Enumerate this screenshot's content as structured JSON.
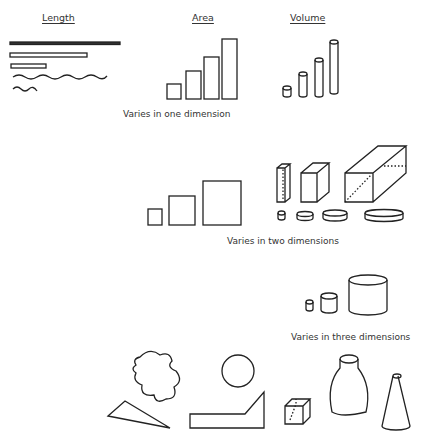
{
  "headers": {
    "length": "Length",
    "area": "Area",
    "volume": "Volume"
  },
  "captions": {
    "one_dimension": "Varies in one dimension",
    "two_dimensions": "Varies in two dimensions",
    "three_dimensions": "Varies in three dimensions"
  }
}
